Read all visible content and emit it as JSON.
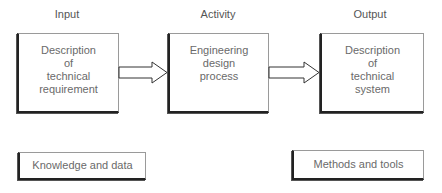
{
  "columns": {
    "input": "Input",
    "activity": "Activity",
    "output": "Output"
  },
  "boxes": {
    "input": "Description\nof\ntechnical\nrequirement",
    "activity": "Engineering\ndesign\nprocess",
    "output": "Description\nof\ntechnical\nsystem",
    "knowledge": "Knowledge and data",
    "methods": "Methods and tools"
  },
  "arrows": [
    {
      "from": "input",
      "to": "activity",
      "style": "hollow-double"
    },
    {
      "from": "activity",
      "to": "output",
      "style": "hollow-double"
    }
  ]
}
